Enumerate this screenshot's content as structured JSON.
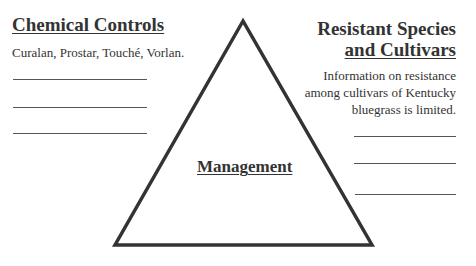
{
  "left": {
    "title": "Chemical Controls",
    "text": "Curalan, Prostar, Touché, Vorlan."
  },
  "right": {
    "title_line1": "Resistant Species",
    "title_line2": "and Cultivars",
    "text_line1": "Information on resistance",
    "text_line2": "among cultivars of Kentucky",
    "text_line3": "bluegrass is limited."
  },
  "center": {
    "label": "Management"
  },
  "colors": {
    "line": "#333333",
    "background": "#ffffff"
  }
}
